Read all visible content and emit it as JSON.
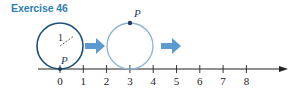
{
  "title": "Exercise 46",
  "colors": {
    "title": "#2f7fb5",
    "circle_start": "#1f4e79",
    "circle_end": "#8fb3d4",
    "arrow": "#5b9bd1",
    "axis": "#222222",
    "point": "#1f3e5c"
  },
  "number_line": {
    "ticks": [
      "0",
      "1",
      "2",
      "3",
      "4",
      "5",
      "6",
      "7",
      "8"
    ],
    "origin_x": 60,
    "unit_px": 23.3,
    "axis_y": 69
  },
  "circles": [
    {
      "label_radius": "1",
      "point_label": "P",
      "point_position": "bottom",
      "center_value": 0
    },
    {
      "point_label": "P",
      "point_position": "top",
      "center_value": 3
    }
  ],
  "arrows": [
    {
      "from": "circle-1",
      "to": "circle-2"
    },
    {
      "from": "circle-2",
      "to": "right"
    }
  ]
}
